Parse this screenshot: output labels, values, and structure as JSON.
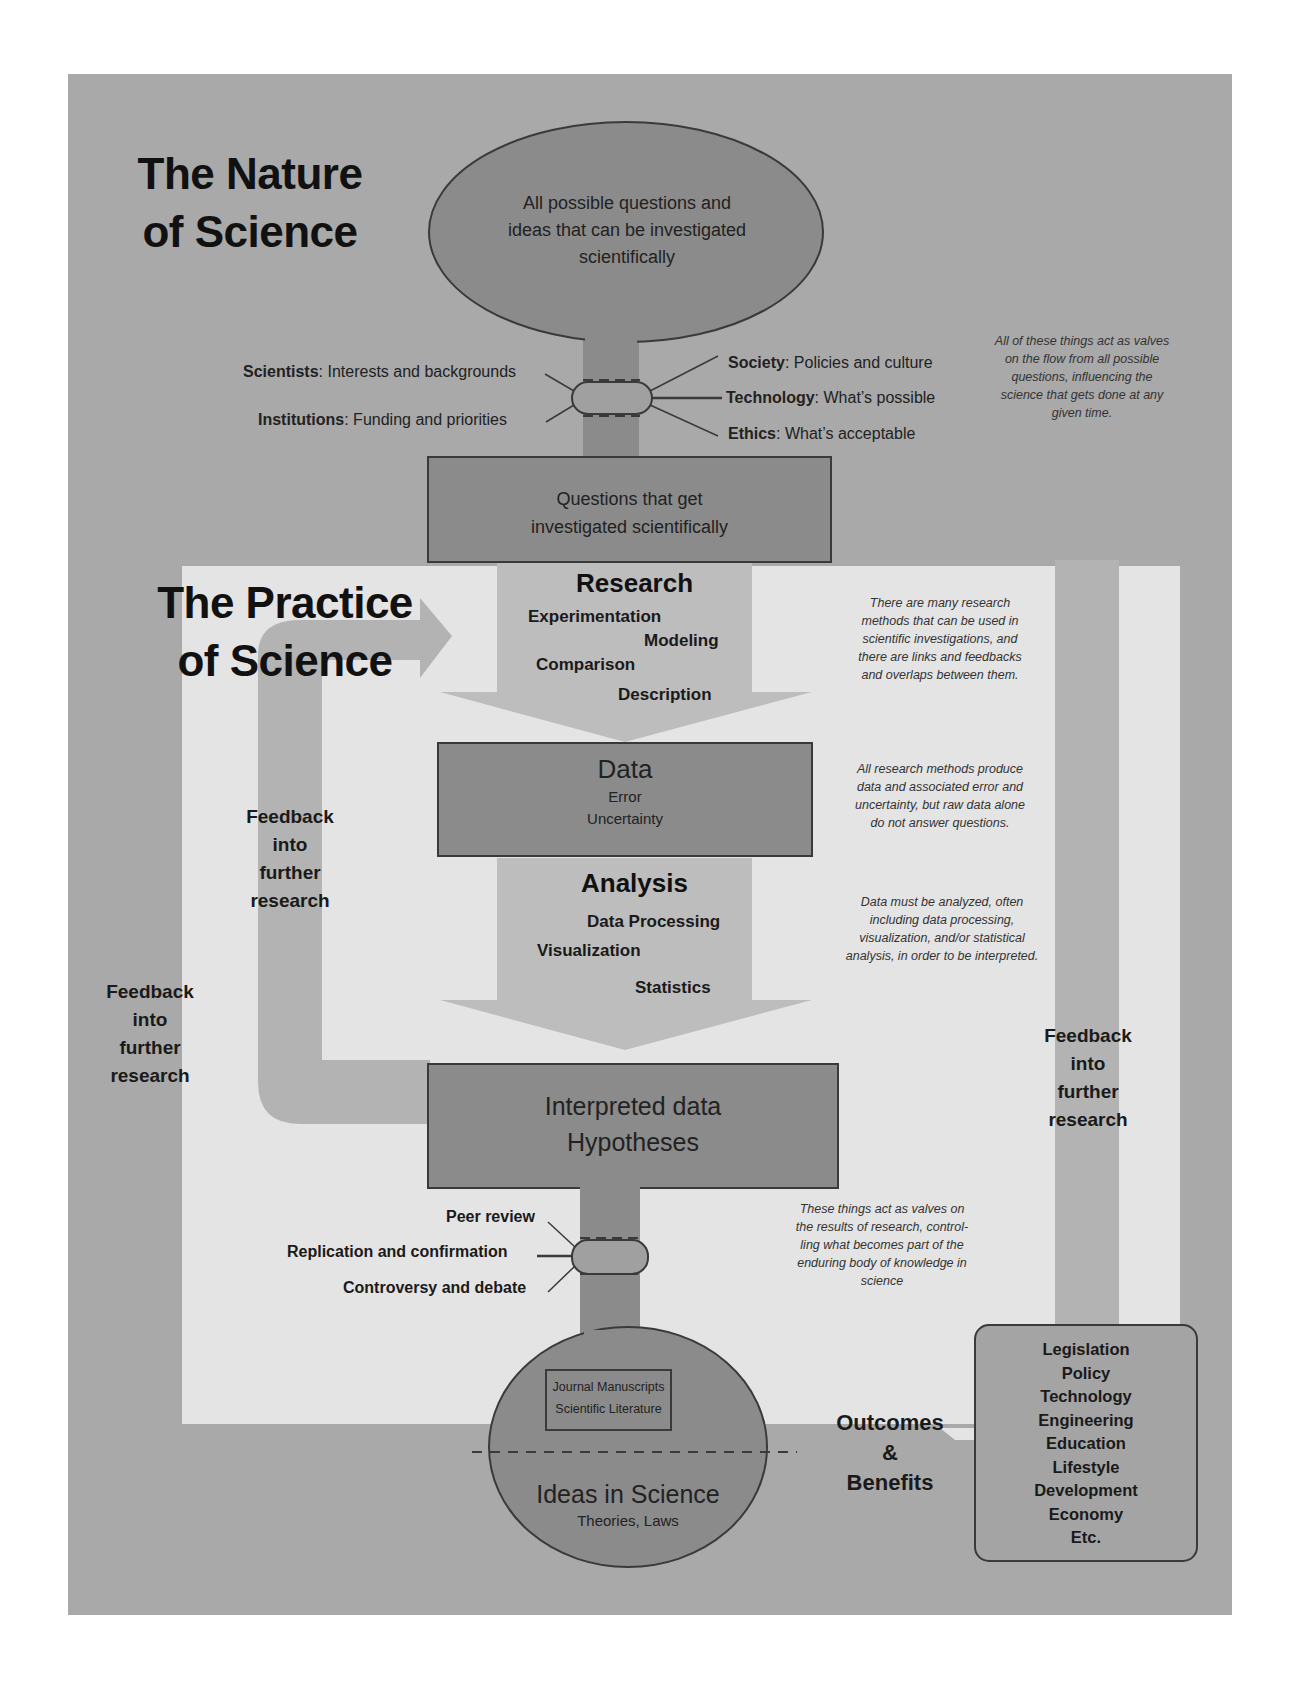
{
  "nature": {
    "title_line1": "The Nature",
    "title_line2": "of Science",
    "top_oval": {
      "lines": [
        "All possible questions and",
        "ideas that can be investigated",
        "scientifically"
      ]
    },
    "valves_left": [
      {
        "bold": "Scientists",
        "text": ": Interests and backgrounds"
      },
      {
        "bold": "Institutions",
        "text": ": Funding and priorities"
      }
    ],
    "valves_right": [
      {
        "bold": "Society",
        "text": ": Policies and culture"
      },
      {
        "bold": "Technology",
        "text": ": What’s  possible"
      },
      {
        "bold": "Ethics",
        "text": ": What’s acceptable"
      }
    ],
    "valves_note": [
      "All of these things act as valves",
      "on the flow from all possible",
      "questions, influencing the",
      "science that gets done at any",
      "given time."
    ],
    "questions_box": [
      "Questions that get",
      "investigated scientifically"
    ]
  },
  "practice": {
    "title_line1": "The Practice",
    "title_line2": "of Science",
    "research": {
      "heading": "Research",
      "methods": [
        "Experimentation",
        "Modeling",
        "Comparison",
        "Description"
      ]
    },
    "research_note": [
      "There are many research",
      "methods that can be used in",
      "scientific investigations, and",
      "there are links and feedbacks",
      "and overlaps between them."
    ],
    "data_box": {
      "title": "Data",
      "items": [
        "Error",
        "Uncertainty"
      ]
    },
    "data_note": [
      "All research methods produce",
      "data and associated error and",
      "uncertainty, but raw data alone",
      "do not answer questions."
    ],
    "analysis": {
      "heading": "Analysis",
      "methods": [
        "Data Processing",
        "Visualization",
        "Statistics"
      ]
    },
    "analysis_note": [
      "Data must be analyzed, often",
      "including data processing,",
      "visualization, and/or statistical",
      "analysis, in order to be interpreted."
    ],
    "interpreted_box": [
      "Interpreted data",
      "Hypotheses"
    ],
    "review_valves": [
      "Peer review",
      "Replication and confirmation",
      "Controversy and debate"
    ],
    "review_note": [
      "These things act as valves on",
      "the results of research, control-",
      "ling what becomes part of the",
      "enduring body of knowledge in",
      "science"
    ]
  },
  "feedback": {
    "inner": [
      "Feedback",
      "into",
      "further",
      "research"
    ],
    "outer_left": [
      "Feedback",
      "into",
      "further",
      "research"
    ],
    "outer_right": [
      "Feedback",
      "into",
      "further",
      "research"
    ]
  },
  "bottom_oval": {
    "inner_box": [
      "Journal Manuscripts",
      "Scientific Literature"
    ],
    "title": "Ideas in Science",
    "subtitle": "Theories, Laws"
  },
  "outcomes": {
    "label": [
      "Outcomes",
      "&",
      "Benefits"
    ],
    "items": [
      "Legislation",
      "Policy",
      "Technology",
      "Engineering",
      "Education",
      "Lifestyle",
      "Development",
      "Economy",
      "Etc."
    ]
  },
  "colors": {
    "outer_panel": "#a9a9a9",
    "inner_panel": "#e4e4e4",
    "dark_shape": "#8b8b8b",
    "arrow_fill": "#bdbdbd",
    "feedback_band": "#b3b3b3",
    "outline": "#3a3a3a"
  }
}
